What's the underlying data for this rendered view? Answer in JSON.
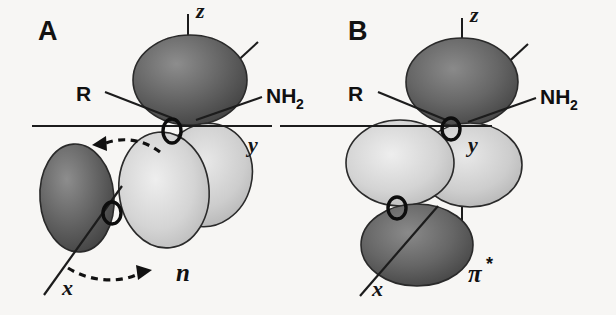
{
  "figure": {
    "background_color": "#f7f6f4",
    "ink_color": "#121212",
    "lobe_dark_color": "#5b5b5b",
    "lobe_light_color": "#cfcfcf"
  },
  "panels": [
    {
      "id": "A",
      "letter": "A",
      "orbital_label": "n",
      "orbital_label_star": "",
      "axes": [
        {
          "name": "z",
          "label": "z"
        },
        {
          "name": "y",
          "label": "y"
        },
        {
          "name": "x",
          "label": "x"
        }
      ],
      "substituents": [
        {
          "name": "R",
          "label": "R"
        },
        {
          "name": "NH2",
          "label": "NH",
          "subscript": "2"
        }
      ],
      "lobes": [
        {
          "name": "top-lobe",
          "shade": "dark"
        },
        {
          "name": "mid-right-lobe",
          "shade": "light"
        },
        {
          "name": "mid-front-lobe",
          "shade": "light"
        },
        {
          "name": "lower-left-lobe",
          "shade": "dark"
        }
      ],
      "nodes": [
        {
          "name": "upper-node"
        },
        {
          "name": "lower-node"
        }
      ],
      "rotation_arrows": [
        {
          "name": "upper-rotation-arrow",
          "direction": "left"
        },
        {
          "name": "lower-rotation-arrow",
          "direction": "right"
        }
      ]
    },
    {
      "id": "B",
      "letter": "B",
      "orbital_label": "π",
      "orbital_label_star": "*",
      "axes": [
        {
          "name": "z",
          "label": "z"
        },
        {
          "name": "y",
          "label": "y"
        },
        {
          "name": "x",
          "label": "x"
        }
      ],
      "substituents": [
        {
          "name": "R",
          "label": "R"
        },
        {
          "name": "NH2",
          "label": "NH",
          "subscript": "2"
        }
      ],
      "lobes": [
        {
          "name": "top-lobe",
          "shade": "dark"
        },
        {
          "name": "mid-left-lobe",
          "shade": "light"
        },
        {
          "name": "mid-right-lobe",
          "shade": "light"
        },
        {
          "name": "bottom-lobe",
          "shade": "dark"
        }
      ],
      "nodes": [
        {
          "name": "upper-node"
        },
        {
          "name": "lower-node"
        }
      ],
      "rotation_arrows": []
    }
  ]
}
